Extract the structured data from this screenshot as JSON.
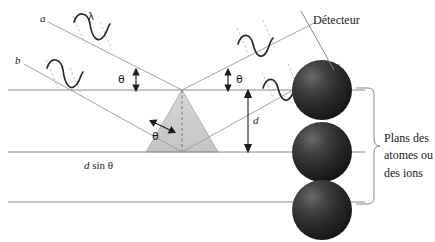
{
  "figure": {
    "language": "fr",
    "width": 435,
    "height": 242,
    "background": "#ffffff"
  },
  "colors": {
    "line": "#8a8a8a",
    "ray": "#9a9a9a",
    "wave": "#2b2b2b",
    "dashed": "#b5b5b5",
    "text": "#1b1b1b",
    "triangle_fill": "#cfcfcf",
    "triangle_stroke": "#9a9a9a",
    "sphere_dark": "#1f1f1f",
    "sphere_mid": "#3a3a3a",
    "sphere_light": "#555555",
    "brace": "#8a8a8a"
  },
  "labels": {
    "ray_a": "a",
    "ray_b": "b",
    "wavelength": "λ",
    "theta_left": "θ",
    "theta_right": "θ",
    "theta_triangle": "θ",
    "spacing": "d",
    "path_difference": "d sin θ",
    "path_difference_italic": "d",
    "path_difference_rest": " sin θ",
    "detector": "Détecteur",
    "planes_line1": "Plans des",
    "planes_line2": "atomes ou",
    "planes_line3": "des ions"
  },
  "icons": {
    "arrow_double_vertical": "double-headed-vertical-arrow",
    "arrow_double_angle": "double-headed-angle-arrow",
    "brace": "curly-brace-right"
  },
  "geometry": {
    "planes_y": [
      90,
      152,
      202
    ],
    "plane_x_start": 8,
    "plane_x_end": 365,
    "apex": {
      "x": 182,
      "y": 90
    },
    "lower_vertex": {
      "x": 182,
      "y": 152
    },
    "spheres": [
      {
        "cx": 322,
        "cy": 90,
        "r": 30
      },
      {
        "cx": 322,
        "cy": 152,
        "r": 30
      },
      {
        "cx": 322,
        "cy": 210,
        "r": 30
      }
    ],
    "spacing_arrow": {
      "x": 248,
      "y_top": 92,
      "y_bottom": 150
    },
    "brace": {
      "x": 370,
      "y_top": 88,
      "y_bottom": 204,
      "tip_y": 146
    }
  }
}
